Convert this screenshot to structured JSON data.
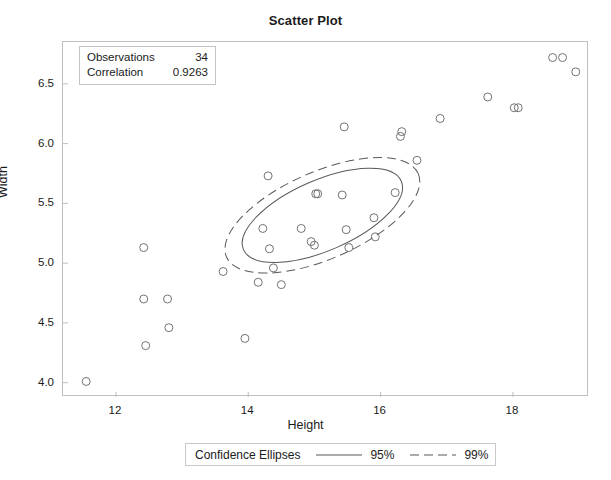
{
  "chart_data": {
    "type": "scatter",
    "title": "Scatter Plot",
    "xlabel": "Height",
    "ylabel": "Width",
    "xlim": [
      11.2,
      19.15
    ],
    "ylim": [
      3.88,
      6.85
    ],
    "xticks": [
      "12",
      "14",
      "16",
      "18"
    ],
    "xtick_values": [
      12,
      14,
      16,
      18
    ],
    "yticks": [
      "4.0",
      "4.5",
      "5.0",
      "5.5",
      "6.0",
      "6.5"
    ],
    "ytick_values": [
      4.0,
      4.5,
      5.0,
      5.5,
      6.0,
      6.5
    ],
    "grid": false,
    "marker": "open-circle",
    "points": [
      {
        "x": 11.55,
        "y": 4.01
      },
      {
        "x": 12.42,
        "y": 5.13
      },
      {
        "x": 12.42,
        "y": 4.7
      },
      {
        "x": 12.45,
        "y": 4.31
      },
      {
        "x": 12.78,
        "y": 4.7
      },
      {
        "x": 12.8,
        "y": 4.46
      },
      {
        "x": 13.62,
        "y": 4.93
      },
      {
        "x": 13.95,
        "y": 4.37
      },
      {
        "x": 14.15,
        "y": 4.84
      },
      {
        "x": 14.22,
        "y": 5.29
      },
      {
        "x": 14.3,
        "y": 5.73
      },
      {
        "x": 14.32,
        "y": 5.12
      },
      {
        "x": 14.38,
        "y": 4.96
      },
      {
        "x": 14.5,
        "y": 4.82
      },
      {
        "x": 14.8,
        "y": 5.29
      },
      {
        "x": 14.95,
        "y": 5.18
      },
      {
        "x": 15.0,
        "y": 5.15
      },
      {
        "x": 15.02,
        "y": 5.58
      },
      {
        "x": 15.05,
        "y": 5.58
      },
      {
        "x": 15.42,
        "y": 5.57
      },
      {
        "x": 15.45,
        "y": 6.14
      },
      {
        "x": 15.48,
        "y": 5.28
      },
      {
        "x": 15.52,
        "y": 5.13
      },
      {
        "x": 15.9,
        "y": 5.38
      },
      {
        "x": 15.92,
        "y": 5.22
      },
      {
        "x": 16.22,
        "y": 5.59
      },
      {
        "x": 16.3,
        "y": 6.06
      },
      {
        "x": 16.32,
        "y": 6.1
      },
      {
        "x": 16.55,
        "y": 5.86
      },
      {
        "x": 16.9,
        "y": 6.21
      },
      {
        "x": 17.62,
        "y": 6.39
      },
      {
        "x": 18.02,
        "y": 6.3
      },
      {
        "x": 18.08,
        "y": 6.3
      },
      {
        "x": 18.6,
        "y": 6.72
      },
      {
        "x": 18.75,
        "y": 6.72
      },
      {
        "x": 18.95,
        "y": 6.6
      }
    ],
    "ellipses": [
      {
        "name": "95%",
        "style": "solid",
        "center_x": 15.12,
        "center_y": 5.4,
        "semi_major": 1.3,
        "semi_minor": 0.295,
        "angle_deg": 23.5
      },
      {
        "name": "99%",
        "style": "dashed",
        "center_x": 15.12,
        "center_y": 5.4,
        "semi_major": 1.58,
        "semi_minor": 0.365,
        "angle_deg": 23.5
      }
    ]
  },
  "stats_box": {
    "rows": [
      {
        "label": "Observations",
        "value": "34"
      },
      {
        "label": "Correlation",
        "value": "0.9263"
      }
    ]
  },
  "legend": {
    "title": "Confidence Ellipses",
    "entries": [
      {
        "label": "95%",
        "style": "solid"
      },
      {
        "label": "99%",
        "style": "dashed"
      }
    ]
  },
  "colors": {
    "marker_stroke": "#737373",
    "ellipse_stroke": "#595959",
    "frame": "#bfbfbf",
    "text": "#1a1a1a",
    "background": "#ffffff"
  }
}
